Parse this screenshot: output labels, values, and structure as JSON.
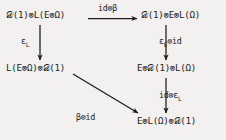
{
  "diagram": {
    "kind": "commutative-diagram",
    "background_color": "#f2f1ef",
    "ink_color": "#1c1c1c",
    "nodes": [
      {
        "id": "top-left",
        "label": "𝒟(1)⊗L(E⊗Ω)",
        "x": 6,
        "y": 9
      },
      {
        "id": "top-right",
        "label": "𝒟(1)⊗E⊗L(Ω)",
        "x": 141,
        "y": 9
      },
      {
        "id": "middle-left",
        "label": "L(E⊗Ω)⊗𝒟(1)",
        "x": 6,
        "y": 62
      },
      {
        "id": "middle-right",
        "label": "E⊗𝒟(1)⊗L(Ω)",
        "x": 137,
        "y": 62
      },
      {
        "id": "bottom-right",
        "label": "E⊗L(Ω)⊗𝒟(1)",
        "x": 137,
        "y": 115
      }
    ],
    "arrows": [
      {
        "id": "top-horizontal",
        "from": "top-left",
        "to": "top-right",
        "direction": "right",
        "label_main": "id⊗β",
        "label_sub": ""
      },
      {
        "id": "left-vertical",
        "from": "top-left",
        "to": "middle-left",
        "direction": "down",
        "label_main": "ε",
        "label_sub": "L"
      },
      {
        "id": "right-vertical-1",
        "from": "top-right",
        "to": "middle-right",
        "direction": "down",
        "label_main": "ε",
        "label_sub": "E",
        "label_tail": "⊗id"
      },
      {
        "id": "right-vertical-2",
        "from": "middle-right",
        "to": "bottom-right",
        "direction": "down",
        "label_main": "id⊗ε",
        "label_sub": "L"
      },
      {
        "id": "diagonal",
        "from": "middle-left",
        "to": "bottom-right",
        "direction": "down-right",
        "label_main": "β⊗id",
        "label_sub": ""
      }
    ]
  }
}
